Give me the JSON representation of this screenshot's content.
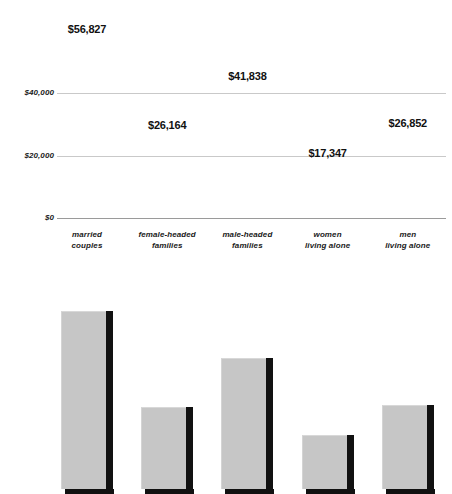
{
  "chart_data": {
    "type": "bar",
    "title": "",
    "subtitle": "",
    "xlabel": "",
    "ylabel": "",
    "categories": [
      "married couples",
      "female-headed families",
      "male-headed families",
      "women living alone",
      "men living alone"
    ],
    "category_lines": [
      [
        "married",
        "couples"
      ],
      [
        "female-headed",
        "families"
      ],
      [
        "male-headed",
        "families"
      ],
      [
        "women",
        "living alone"
      ],
      [
        "men",
        "living alone"
      ]
    ],
    "values": [
      56827,
      41838,
      26164,
      17347,
      26852
    ],
    "values_by_category": [
      {
        "category": "married couples",
        "value": 56827,
        "label": "$56,827"
      },
      {
        "category": "female-headed families",
        "value": 26164,
        "label": "$26,164"
      },
      {
        "category": "male-headed families",
        "value": 41838,
        "label": "$41,838"
      },
      {
        "category": "women living alone",
        "value": 17347,
        "label": "$17,347"
      },
      {
        "category": "men living alone",
        "value": 26852,
        "label": "$26,852"
      }
    ],
    "data_labels": [
      "$56,827",
      "$26,164",
      "$41,838",
      "$17,347",
      "$26,852"
    ],
    "ylim": [
      0,
      60000
    ],
    "yticks": [
      0,
      20000,
      40000
    ],
    "ytick_labels": [
      "$0",
      "$20,000",
      "$40,000"
    ],
    "grid": true,
    "legend": false,
    "legend_position": "none",
    "bar_style": "3d",
    "colors": {
      "bar_face": "#c6c6c6",
      "bar_shade": "#111111",
      "gridline": "#c9c9c9",
      "baseline": "#9a9a9a",
      "text": "#1a1a1a",
      "background": "#ffffff"
    }
  }
}
